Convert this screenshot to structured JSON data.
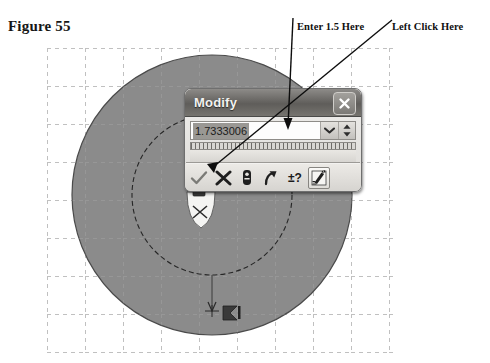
{
  "figure": {
    "label": "Figure 55"
  },
  "annotations": [
    {
      "id": "enter-value",
      "text": "Enter 1.5 Here",
      "points_to": "value-input"
    },
    {
      "id": "left-click",
      "text": "Left Click Here",
      "points_to": "cancel-button"
    }
  ],
  "dialog": {
    "title": "Modify",
    "close_label": "✕",
    "value": "1.7333006",
    "value_placeholder": "1.7333006",
    "dropdown_icon": "chevron-down-icon",
    "spinner_icon": "spinner-up-down-icon",
    "toolbar": [
      {
        "id": "accept",
        "icon": "checkmark-icon",
        "label": "Accept",
        "pressed": false
      },
      {
        "id": "cancel",
        "icon": "cross-x-icon",
        "label": "Cancel",
        "pressed": false
      },
      {
        "id": "lock",
        "icon": "lock-icon",
        "label": "Lock Dimension",
        "pressed": false
      },
      {
        "id": "arrow",
        "icon": "curved-arrow-icon",
        "label": "Reverse Direction",
        "pressed": false
      },
      {
        "id": "tolerance",
        "icon": "plus-minus-question-icon",
        "label": "Tolerance",
        "pressed": false
      },
      {
        "id": "edit-units",
        "icon": "pencil-measure-icon",
        "label": "Edit Units",
        "pressed": true
      }
    ]
  },
  "canvas": {
    "grid_style": "dashed",
    "outer_circle": {
      "label": "extruded-disc",
      "fill": "#8b8b8b",
      "stroke": "#3a3a3a"
    },
    "inner_circle": {
      "label": "sketch-circle",
      "stroke": "#2b2b2b",
      "dash": true
    },
    "dimension_marker": {
      "text": "1",
      "icon": "dimension-arrow-icon"
    },
    "drag_handle": {
      "icon": "drag-handle-icon"
    }
  },
  "colors": {
    "disc_fill": "#8b8b8b",
    "grid": "#b9b9b9",
    "titlebar_dark": "#5f5d5a",
    "dialog_face": "#e2e0dc",
    "annotation_text": "#101010"
  }
}
